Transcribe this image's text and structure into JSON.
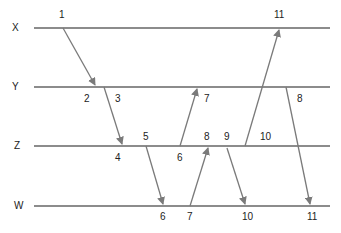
{
  "diagram": {
    "type": "space-time message diagram",
    "line_color": "#8c8c8c",
    "processes": [
      {
        "name": "X",
        "y": 28,
        "label_x": 12
      },
      {
        "name": "Y",
        "y": 87,
        "label_x": 12
      },
      {
        "name": "Z",
        "y": 146,
        "label_x": 14
      },
      {
        "name": "W",
        "y": 206,
        "label_x": 14
      }
    ],
    "line_x_start": 34,
    "line_x_end": 330,
    "messages": [
      {
        "from": "X",
        "to": "Y",
        "x1": 63,
        "y1": 28,
        "x2": 95,
        "y2": 85
      },
      {
        "from": "Y",
        "to": "Z",
        "x1": 104,
        "y1": 87,
        "x2": 122,
        "y2": 144
      },
      {
        "from": "Z",
        "to": "W",
        "x1": 146,
        "y1": 146,
        "x2": 163,
        "y2": 204
      },
      {
        "from": "Z",
        "to": "Y",
        "x1": 180,
        "y1": 146,
        "x2": 197,
        "y2": 89
      },
      {
        "from": "W",
        "to": "Z",
        "x1": 190,
        "y1": 206,
        "x2": 208,
        "y2": 148
      },
      {
        "from": "Z",
        "to": "W",
        "x1": 227,
        "y1": 148,
        "x2": 245,
        "y2": 204
      },
      {
        "from": "Z",
        "to": "X",
        "x1": 245,
        "y1": 146,
        "x2": 279,
        "y2": 30
      },
      {
        "from": "Y",
        "to": "W",
        "x1": 286,
        "y1": 87,
        "x2": 310,
        "y2": 204
      }
    ],
    "labels": [
      {
        "text": "1",
        "x": 59,
        "y": 10
      },
      {
        "text": "11",
        "x": 274,
        "y": 10
      },
      {
        "text": "2",
        "x": 84,
        "y": 94
      },
      {
        "text": "3",
        "x": 115,
        "y": 94
      },
      {
        "text": "7",
        "x": 204,
        "y": 94
      },
      {
        "text": "8",
        "x": 297,
        "y": 94
      },
      {
        "text": "5",
        "x": 143,
        "y": 132
      },
      {
        "text": "8",
        "x": 204,
        "y": 132
      },
      {
        "text": "9",
        "x": 224,
        "y": 132
      },
      {
        "text": "10",
        "x": 260,
        "y": 132
      },
      {
        "text": "4",
        "x": 115,
        "y": 153
      },
      {
        "text": "6",
        "x": 177,
        "y": 153
      },
      {
        "text": "6",
        "x": 160,
        "y": 212
      },
      {
        "text": "7",
        "x": 187,
        "y": 212
      },
      {
        "text": "10",
        "x": 242,
        "y": 212
      },
      {
        "text": "11",
        "x": 307,
        "y": 212
      }
    ]
  }
}
